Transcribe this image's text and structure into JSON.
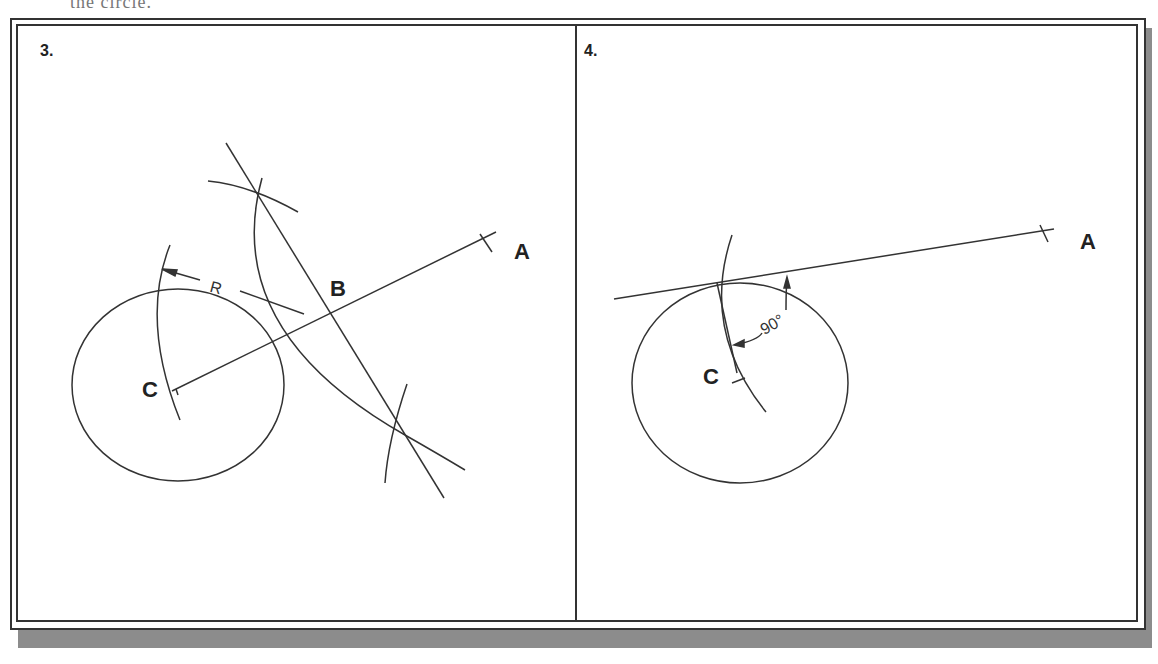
{
  "header_fragment": "the circle.",
  "panels": [
    {
      "step": "3.",
      "points": {
        "A": "A",
        "B": "B",
        "C": "C"
      },
      "dimension_label": "R"
    },
    {
      "step": "4.",
      "points": {
        "A": "A",
        "C": "C"
      },
      "angle_label": "90°"
    }
  ],
  "colors": {
    "line": "#333333",
    "frame": "#333333",
    "shadow": "#8c8c8c",
    "background": "#ffffff"
  }
}
